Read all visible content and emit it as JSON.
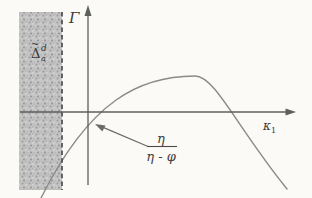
{
  "figure": {
    "description_labels": {
      "y_axis": "Γ",
      "x_axis_base": "κ",
      "x_axis_sub": "1",
      "region_delta": "Δ",
      "region_tilde": "~",
      "region_sup": "d",
      "region_sub": "a",
      "fraction_numerator": "η",
      "fraction_denominator": "η - φ"
    },
    "colors": {
      "background": "#fbfaf7",
      "curve": "#8a8a8a",
      "axis": "#5e5e5e",
      "dashed_line": "#4d4d4d",
      "text": "#3c3c3c",
      "region_fill_base": "#c3c3c3",
      "region_stipple_dark": "#8f8f8f",
      "region_stipple_light": "#dcdcdc"
    }
  }
}
